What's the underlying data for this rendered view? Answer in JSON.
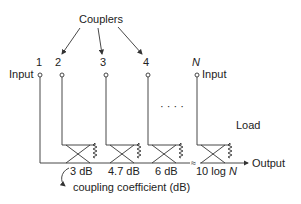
{
  "diagram": {
    "title_label": "Couplers",
    "port_numbers": [
      "1",
      "2",
      "3",
      "4",
      "N"
    ],
    "input_label_left": "Input",
    "input_label_right": "Input",
    "ellipsis": "· · · ·",
    "load_label": "Load",
    "output_label": "Output",
    "break_symbol": "≈",
    "coupling_values": [
      "3 dB",
      "4.7 dB",
      "6 dB",
      "10 log N"
    ],
    "coupling_prefix_last": "10 log ",
    "coupling_var_last": "N",
    "coupling_caption": "coupling coefficient (dB)"
  }
}
